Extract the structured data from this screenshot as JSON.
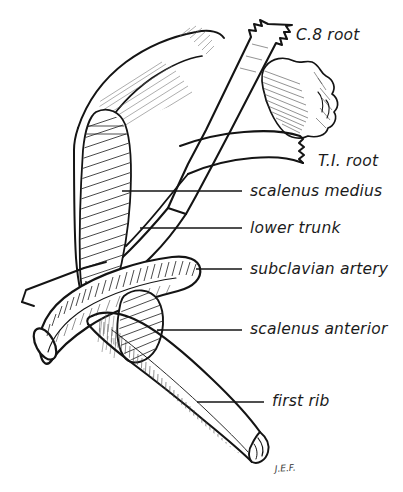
{
  "figure": {
    "signature": "J.E.F.",
    "background_color": "#ffffff",
    "ink_color": "#141414"
  },
  "labels": [
    {
      "id": "c8-root",
      "text": "C.8 root",
      "text_x": 296,
      "text_y": 40,
      "has_leader": false
    },
    {
      "id": "t1-root",
      "text": "T.I. root",
      "text_x": 318,
      "text_y": 166,
      "has_leader": false
    },
    {
      "id": "scalenus-medius",
      "text": "scalenus medius",
      "text_x": 250,
      "text_y": 196,
      "has_leader": true,
      "leader_x1": 122,
      "leader_y1": 191,
      "leader_x2": 242,
      "leader_y2": 191
    },
    {
      "id": "lower-trunk",
      "text": "lower trunk",
      "text_x": 250,
      "text_y": 233,
      "has_leader": true,
      "leader_x1": 140,
      "leader_y1": 228,
      "leader_x2": 242,
      "leader_y2": 228
    },
    {
      "id": "subclavian-artery",
      "text": "subclavian artery",
      "text_x": 250,
      "text_y": 274,
      "has_leader": true,
      "leader_x1": 196,
      "leader_y1": 269,
      "leader_x2": 242,
      "leader_y2": 269
    },
    {
      "id": "scalenus-anterior",
      "text": "scalenus anterior",
      "text_x": 250,
      "text_y": 334,
      "has_leader": true,
      "leader_x1": 157,
      "leader_y1": 330,
      "leader_x2": 242,
      "leader_y2": 330
    },
    {
      "id": "first-rib",
      "text": "first rib",
      "text_x": 272,
      "text_y": 406,
      "has_leader": true,
      "leader_x1": 197,
      "leader_y1": 402,
      "leader_x2": 264,
      "leader_y2": 402
    }
  ],
  "structures": [
    {
      "id": "c8-root-band",
      "name": "C.8 nerve root",
      "description": "diagonal band with jagged cut end at upper right"
    },
    {
      "id": "t1-root-band",
      "name": "T.I. nerve root",
      "description": "band entering from right with jagged cut end"
    },
    {
      "id": "lower-trunk-band",
      "name": "lower trunk",
      "description": "union of C.8 and T.I roots passing downward"
    },
    {
      "id": "scalenus-medius-muscle",
      "name": "scalenus medius",
      "description": "tall obliquely hatched muscle belly, stippled inferior end"
    },
    {
      "id": "scalenus-anterior-muscle",
      "name": "scalenus anterior",
      "description": "hatched wedge inserting on first rib"
    },
    {
      "id": "subclavian-artery-vessel",
      "name": "subclavian artery",
      "description": "thick curved tube with open cut end at lower left"
    },
    {
      "id": "first-rib-bone",
      "name": "first rib",
      "description": "broad flat bone sweeping inferolaterally to a pointed tip"
    },
    {
      "id": "transverse-process-bone",
      "name": "vertebral transverse process",
      "description": "irregular hatched bone at upper right"
    }
  ]
}
